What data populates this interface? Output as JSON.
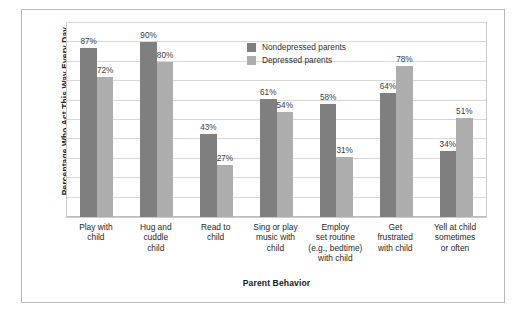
{
  "chart_data": {
    "type": "bar",
    "title": "",
    "xlabel": "Parent Behavior",
    "ylabel": "Percentage Who Act This Way Every Day",
    "ylim": [
      0,
      100
    ],
    "grid": true,
    "legend_position": "top-center",
    "categories": [
      "Play with child",
      "Hug and cuddle child",
      "Read to child",
      "Sing or play music with child",
      "Employ set routine (e.g., bedtime) with child",
      "Get frustrated with child",
      "Yell at child sometimes or often"
    ],
    "category_lines": [
      [
        "Play with",
        "child"
      ],
      [
        "Hug and",
        "cuddle",
        "child"
      ],
      [
        "Read to",
        "child"
      ],
      [
        "Sing or play",
        "music with",
        "child"
      ],
      [
        "Employ",
        "set routine",
        "(e.g., bedtime)",
        "with child"
      ],
      [
        "Get",
        "frustrated",
        "with child"
      ],
      [
        "Yell at child",
        "sometimes",
        "or often"
      ]
    ],
    "series": [
      {
        "name": "Nondepressed parents",
        "color": "#7f7f7f",
        "values": [
          87,
          90,
          43,
          61,
          58,
          64,
          34
        ],
        "labels": [
          "87%",
          "90%",
          "43%",
          "61%",
          "58%",
          "64%",
          "34%"
        ]
      },
      {
        "name": "Depressed parents",
        "color": "#adadad",
        "values": [
          72,
          80,
          27,
          54,
          31,
          78,
          51
        ],
        "labels": [
          "72%",
          "80%",
          "27%",
          "54%",
          "31%",
          "78%",
          "51%"
        ]
      }
    ]
  }
}
